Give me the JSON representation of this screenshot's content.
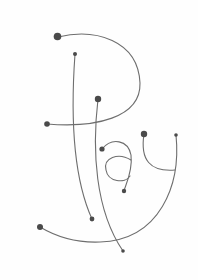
{
  "artwork": {
    "word": "Play",
    "description": "Hand-drawn line lettering with dot terminals",
    "colors": {
      "background": "#fefefe",
      "stroke": "#6e6e6e",
      "dot": "#4a4a4a"
    }
  }
}
